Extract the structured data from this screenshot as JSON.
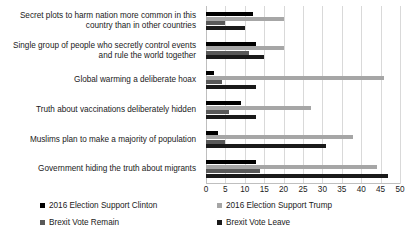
{
  "chart_data": {
    "type": "bar",
    "orientation": "horizontal",
    "title": "",
    "subtitle": "",
    "xlabel": "",
    "ylabel": "",
    "xlim": [
      0,
      50
    ],
    "xticks": [
      0,
      5,
      10,
      15,
      20,
      25,
      30,
      35,
      40,
      45,
      50
    ],
    "grid": true,
    "legend_position": "bottom",
    "categories": [
      "Secret plots to harm nation more common in this country than in other countries",
      "Single group of people who secretly control events and rule the world together",
      "Global warming a deliberate hoax",
      "Truth about vaccinations deliberately hidden",
      "Muslims plan to make a majority of population",
      "Government hiding the truth about migrants"
    ],
    "series": [
      {
        "name": "2016 Election Support Clinton",
        "color": "#000000",
        "values": [
          12,
          13,
          2,
          9,
          3,
          13
        ]
      },
      {
        "name": "2016 Election Support Trump",
        "color": "#a6a6a6",
        "values": [
          20,
          20,
          46,
          27,
          38,
          44
        ]
      },
      {
        "name": "Brexit Vote Remain",
        "color": "#595959",
        "values": [
          5,
          11,
          4,
          6,
          5,
          14
        ]
      },
      {
        "name": "Brexit Vote Leave",
        "color": "#1a1a1a",
        "values": [
          10,
          15,
          13,
          13,
          31,
          47
        ]
      }
    ]
  }
}
